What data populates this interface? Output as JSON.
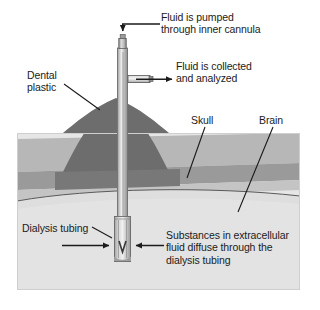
{
  "figure": {
    "type": "scientific-schematic",
    "canvas": {
      "width": 316,
      "height": 310
    },
    "panel": {
      "x": 17,
      "y": 133,
      "width": 283,
      "height": 157
    },
    "labels": {
      "fluid_pumped": "Fluid is pumped\nthrough inner cannula",
      "fluid_collected": "Fluid is collected\nand analyzed",
      "dental_plastic": "Dental\nplastic",
      "skull": "Skull",
      "brain": "Brain",
      "dialysis_tubing": "Dialysis tubing",
      "substances": "Substances in extracellular\nfluid diffuse through the\ndialysis tubing"
    },
    "colors": {
      "background": "#ffffff",
      "scalp": "#b9b9b9",
      "skull_band": "#9a9a9a",
      "brain": "#dcdcdc",
      "panel_light": "#e2e2e2",
      "dental_plastic": "#6e6e6e",
      "probe_body": "#b5b5b5",
      "probe_highlight": "#e8e8e8",
      "probe_shadow": "#8a8a8a",
      "outline": "#1b1b1b",
      "text": "#1b1b1b"
    },
    "icon_names": [
      "arrow-down-inlet-icon",
      "arrow-right-outlet-icon",
      "arrow-right-diffuse-left-icon",
      "arrow-left-diffuse-right-icon",
      "leader-line-dental-plastic",
      "leader-line-skull",
      "leader-line-brain",
      "leader-line-dialysis-tubing"
    ]
  }
}
